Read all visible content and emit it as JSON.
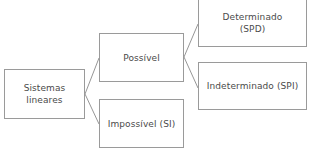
{
  "diagram": {
    "type": "tree",
    "line_color": "#8a8a8a",
    "border_color": "#9a9a9a",
    "text_color": "#4a4a4a",
    "nodes": {
      "root": {
        "lines": [
          "Sistemas",
          "lineares"
        ]
      },
      "possible": {
        "lines": [
          "Possível"
        ]
      },
      "impossible": {
        "lines": [
          "Impossível (SI)"
        ]
      },
      "determined": {
        "lines": [
          "Determinado",
          "(SPD)"
        ]
      },
      "undetermined": {
        "lines": [
          "Indeterminado (SPI)"
        ]
      }
    },
    "edges": [
      {
        "from": "root",
        "to": "possible"
      },
      {
        "from": "root",
        "to": "impossible"
      },
      {
        "from": "possible",
        "to": "determined"
      },
      {
        "from": "possible",
        "to": "undetermined"
      }
    ]
  }
}
